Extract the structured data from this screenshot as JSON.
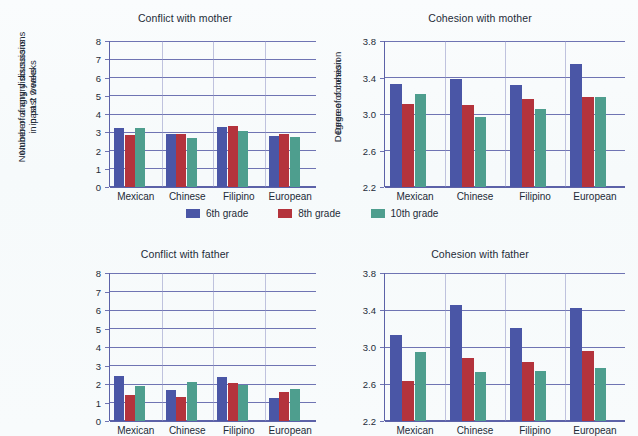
{
  "figure": {
    "background_color": "#f8fbfc",
    "grid_color": "#6f74b3",
    "text_color": "#1d2b38"
  },
  "legend": {
    "position": "center-middle",
    "items": [
      {
        "label": "6th grade",
        "color": "#4a56a6"
      },
      {
        "label": "8th grade",
        "color": "#b4333c"
      },
      {
        "label": "10th grade",
        "color": "#4e9e8e"
      }
    ]
  },
  "chart_data": [
    {
      "type": "bar",
      "title": "Conflict with mother",
      "panel": "top-left",
      "xlabel": "",
      "ylabel": "Number of angry discussions in past 2 weeks",
      "ylabel_lines": [
        "Number of angry discussions",
        "in past 2 weeks"
      ],
      "categories": [
        "Mexican",
        "Chinese",
        "Filipino",
        "European"
      ],
      "ylim": [
        0,
        8
      ],
      "yticks": [
        0,
        1,
        2,
        3,
        4,
        5,
        6,
        7,
        8
      ],
      "ytick_labels": [
        "0",
        "1",
        "2",
        "3",
        "4",
        "5",
        "6",
        "7",
        "8"
      ],
      "grid": true,
      "series": [
        {
          "name": "6th grade",
          "color": "#4a56a6",
          "values": [
            3.25,
            2.92,
            3.27,
            2.8
          ]
        },
        {
          "name": "8th grade",
          "color": "#b4333c",
          "values": [
            2.85,
            2.9,
            3.37,
            2.9
          ]
        },
        {
          "name": "10th grade",
          "color": "#4e9e8e",
          "values": [
            3.21,
            2.7,
            3.05,
            2.72
          ]
        }
      ]
    },
    {
      "type": "bar",
      "title": "Cohesion with mother",
      "panel": "top-right",
      "xlabel": "",
      "ylabel": "Degree of cohesion",
      "ylabel_lines": [
        "Degree of cohesion"
      ],
      "categories": [
        "Mexican",
        "Chinese",
        "Filipino",
        "European"
      ],
      "ylim": [
        2.2,
        3.8
      ],
      "yticks": [
        2.2,
        2.6,
        3.0,
        3.4,
        3.8
      ],
      "ytick_labels": [
        "2.2",
        "2.6",
        "3.0",
        "3.4",
        "3.8"
      ],
      "grid": true,
      "series": [
        {
          "name": "6th grade",
          "color": "#4a56a6",
          "values": [
            3.33,
            3.38,
            3.32,
            3.55
          ]
        },
        {
          "name": "8th grade",
          "color": "#b4333c",
          "values": [
            3.11,
            3.1,
            3.16,
            3.19
          ]
        },
        {
          "name": "10th grade",
          "color": "#4e9e8e",
          "values": [
            3.22,
            2.97,
            3.06,
            3.19
          ]
        }
      ]
    },
    {
      "type": "bar",
      "title": "Conflict with father",
      "panel": "bottom-left",
      "xlabel": "",
      "ylabel": "Number of angry discussions in past 2 weeks",
      "ylabel_lines": [
        "Number of angry discussions",
        "in past 2 weeks"
      ],
      "categories": [
        "Mexican",
        "Chinese",
        "Filipino",
        "European"
      ],
      "ylim": [
        0,
        8
      ],
      "yticks": [
        0,
        1,
        2,
        3,
        4,
        5,
        6,
        7,
        8
      ],
      "ytick_labels": [
        "0",
        "1",
        "2",
        "3",
        "4",
        "5",
        "6",
        "7",
        "8"
      ],
      "grid": true,
      "series": [
        {
          "name": "6th grade",
          "color": "#4a56a6",
          "values": [
            2.45,
            1.65,
            2.37,
            1.22
          ]
        },
        {
          "name": "8th grade",
          "color": "#b4333c",
          "values": [
            1.4,
            1.3,
            2.05,
            1.55
          ]
        },
        {
          "name": "10th grade",
          "color": "#4e9e8e",
          "values": [
            1.88,
            2.1,
            1.93,
            1.75
          ]
        }
      ]
    },
    {
      "type": "bar",
      "title": "Cohesion with father",
      "panel": "bottom-right",
      "xlabel": "",
      "ylabel": "Degree of cohesion",
      "ylabel_lines": [
        "Degree of cohesion"
      ],
      "categories": [
        "Mexican",
        "Chinese",
        "Filipino",
        "European"
      ],
      "ylim": [
        2.2,
        3.8
      ],
      "yticks": [
        2.2,
        2.6,
        3.0,
        3.4,
        3.8
      ],
      "ytick_labels": [
        "2.2",
        "2.6",
        "3.0",
        "3.4",
        "3.8"
      ],
      "grid": true,
      "series": [
        {
          "name": "6th grade",
          "color": "#4a56a6",
          "values": [
            3.13,
            3.45,
            3.21,
            3.42
          ]
        },
        {
          "name": "8th grade",
          "color": "#b4333c",
          "values": [
            2.63,
            2.88,
            2.84,
            2.96
          ]
        },
        {
          "name": "10th grade",
          "color": "#4e9e8e",
          "values": [
            2.95,
            2.73,
            2.74,
            2.77
          ]
        }
      ]
    }
  ]
}
